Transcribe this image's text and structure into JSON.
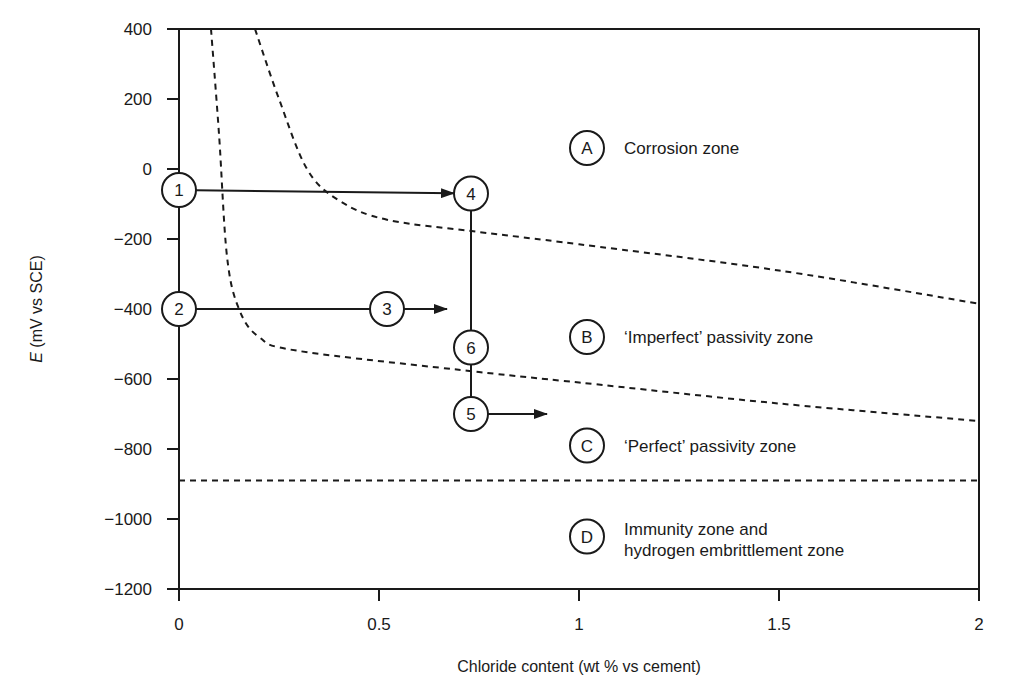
{
  "chart_data": {
    "type": "line",
    "title": "",
    "xlabel": "Chloride content (wt % vs cement)",
    "ylabel_italic": "E",
    "ylabel_rest": " (mV vs SCE)",
    "ylabel": "E (mV vs SCE)",
    "xlim": [
      0,
      2
    ],
    "ylim": [
      -1200,
      400
    ],
    "x_ticks": [
      0,
      0.5,
      1,
      1.5,
      2
    ],
    "x_tick_labels": [
      "0",
      "0.5",
      "1",
      "1.5",
      "2"
    ],
    "y_ticks": [
      400,
      200,
      0,
      -200,
      -400,
      -600,
      -800,
      -1000,
      -1200
    ],
    "y_tick_labels": [
      "400",
      "200",
      "0",
      "−200",
      "−400",
      "−600",
      "−800",
      "−1000",
      "−1200"
    ],
    "grid": false,
    "boundaries": [
      {
        "name": "corrosion / imperfect passivity boundary",
        "style": "dashed",
        "points": [
          [
            0.19,
            400
          ],
          [
            0.25,
            200
          ],
          [
            0.32,
            0
          ],
          [
            0.4,
            -90
          ],
          [
            0.52,
            -145
          ],
          [
            0.75,
            -180
          ],
          [
            1.0,
            -215
          ],
          [
            1.5,
            -290
          ],
          [
            2.0,
            -385
          ]
        ]
      },
      {
        "name": "imperfect / perfect passivity boundary",
        "style": "dashed",
        "points": [
          [
            0.08,
            400
          ],
          [
            0.1,
            100
          ],
          [
            0.12,
            -250
          ],
          [
            0.15,
            -400
          ],
          [
            0.2,
            -480
          ],
          [
            0.3,
            -520
          ],
          [
            0.75,
            -580
          ],
          [
            1.0,
            -610
          ],
          [
            1.5,
            -670
          ],
          [
            2.0,
            -720
          ]
        ]
      },
      {
        "name": "perfect passivity / immunity boundary",
        "style": "dashed",
        "points": [
          [
            0,
            -890
          ],
          [
            2.0,
            -890
          ]
        ]
      }
    ],
    "zones": [
      {
        "id": "A",
        "label": "Corrosion zone",
        "x": 1.0,
        "y": 60
      },
      {
        "id": "B",
        "label": "‘Imperfect’ passivity zone",
        "x": 1.0,
        "y": -480
      },
      {
        "id": "C",
        "label": "‘Perfect’ passivity zone",
        "x": 1.0,
        "y": -790
      },
      {
        "id": "D",
        "label": "Immunity zone and hydrogen embrittlement zone",
        "label_line1": "Immunity zone and",
        "label_line2": "hydrogen embrittlement zone",
        "x": 1.0,
        "y": -1050
      }
    ],
    "states": [
      {
        "id": "1",
        "x": 0,
        "y": -60
      },
      {
        "id": "2",
        "x": 0,
        "y": -400
      },
      {
        "id": "3",
        "x": 0.52,
        "y": -400
      },
      {
        "id": "4",
        "x": 0.73,
        "y": -70
      },
      {
        "id": "5",
        "x": 0.73,
        "y": -700
      },
      {
        "id": "6",
        "x": 0.73,
        "y": -510
      }
    ],
    "paths": [
      {
        "from": "1",
        "to": "4",
        "type": "arrow"
      },
      {
        "from": "2",
        "to": "3",
        "type": "line"
      },
      {
        "from": "3",
        "to_point": [
          0.67,
          -400
        ],
        "type": "arrow"
      },
      {
        "from": "4",
        "to": "6",
        "type": "line"
      },
      {
        "from": "6",
        "to": "5",
        "type": "line"
      },
      {
        "from": "5",
        "to_point": [
          0.92,
          -700
        ],
        "type": "arrow"
      },
      {
        "from": "1",
        "to": "2",
        "type": "line",
        "note": "along y-axis"
      }
    ]
  }
}
